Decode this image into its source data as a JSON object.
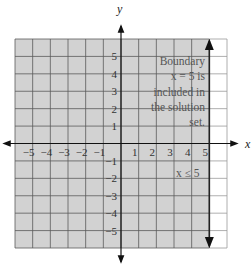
{
  "chart_data": {
    "type": "inequality-graph",
    "title": "",
    "xlabel": "x",
    "ylabel": "y",
    "xlim": [
      -6,
      6
    ],
    "ylim": [
      -6,
      6
    ],
    "grid": true,
    "x_ticks": [
      "-5",
      "-4",
      "-3",
      "-2",
      "-1",
      "1",
      "2",
      "3",
      "4",
      "5"
    ],
    "y_ticks": [
      "5",
      "4",
      "3",
      "2",
      "1",
      "-1",
      "-2",
      "-3",
      "-4",
      "-5"
    ],
    "inequality": "x ≤ 5",
    "boundary": {
      "equation": "x = 5",
      "style": "solid",
      "included": true
    },
    "shaded_region": "x ≤ 5",
    "annotation": [
      "Boundary",
      "x = 5 is",
      "included in",
      "the solution",
      "set."
    ],
    "region_label": "x ≤ 5",
    "colors": {
      "shade": "#d2d2d2",
      "grid": "#5a5a5a",
      "axis": "#111111",
      "unshaded": "#ffffff"
    }
  },
  "labels": {
    "x_axis": "x",
    "y_axis": "y",
    "region": "x ≤ 5",
    "annotation_lines": [
      "Boundary",
      "x = 5 is",
      "included in",
      "the solution",
      "set."
    ]
  }
}
